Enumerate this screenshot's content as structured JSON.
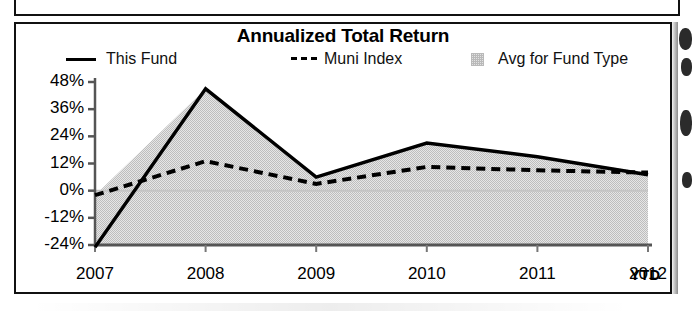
{
  "chart_data": {
    "type": "line",
    "title": "Annualized Total Return",
    "xlabel": "",
    "ylabel": "",
    "grid": false,
    "legend_position": "top",
    "categories": [
      "2007",
      "2008",
      "2009",
      "2010",
      "2011",
      "2012"
    ],
    "x_axis_suffix": "YTD",
    "ytick_labels": [
      "48%",
      "36%",
      "24%",
      "12%",
      "0%",
      "-12%",
      "-24%"
    ],
    "ytick_values": [
      48,
      36,
      24,
      12,
      0,
      -12,
      -24
    ],
    "ylim": [
      -24,
      48
    ],
    "series": [
      {
        "name": "This Fund",
        "style": "solid",
        "color": "#000000",
        "values": [
          -25,
          45,
          6,
          21,
          15,
          7
        ]
      },
      {
        "name": "Muni Index",
        "style": "dashed",
        "color": "#000000",
        "values": [
          -2,
          13,
          3,
          10.5,
          9,
          8
        ]
      },
      {
        "name": "Avg for Fund Type",
        "style": "area",
        "color": "#d9d9d9",
        "values": [
          -2,
          13,
          3,
          10.5,
          9,
          8
        ]
      }
    ]
  },
  "chart": {
    "title": "Annualized Total Return",
    "legend": [
      {
        "label": "This Fund",
        "marker": "solid-line-swatch"
      },
      {
        "label": "Muni Index",
        "marker": "dashed-line-swatch"
      },
      {
        "label": "Avg for Fund Type",
        "marker": "shaded-box-swatch"
      }
    ],
    "y_ticks": [
      "48%",
      "36%",
      "24%",
      "12%",
      "0%",
      "-12%",
      "-24%"
    ],
    "x_ticks": [
      "2007",
      "2008",
      "2009",
      "2010",
      "2011",
      "2012"
    ],
    "x_suffix": "YTD"
  },
  "colors": {
    "ink": "#111111",
    "area_fill": "#d9d9d9",
    "axis": "#555555"
  }
}
